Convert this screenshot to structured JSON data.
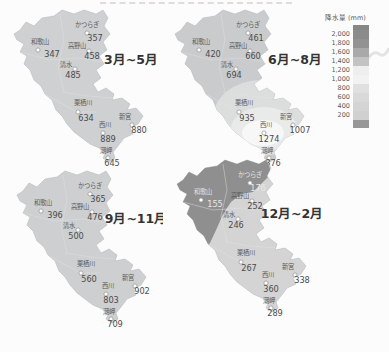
{
  "page": {
    "background": "#fcfcfc"
  },
  "legend": {
    "title": "降水量 (mm)",
    "ticks": [
      "2,000",
      "1,800",
      "1,600",
      "1,400",
      "1,200",
      "1,000",
      "800",
      "600",
      "400",
      "200"
    ],
    "band_colors": [
      "#878787",
      "#8b8b8b",
      "#929292",
      "#a9a9a9",
      "#c3c3c3",
      "#eeeeee",
      "#f2f2f2",
      "#e0e0e0",
      "#d9d9d9",
      "#d4d4d4",
      "#d0d0d0",
      "#979797"
    ]
  },
  "stations": [
    {
      "key": "katsuragi",
      "name": "かつらぎ",
      "nx": 87,
      "ny": 27,
      "dx": 87,
      "dy": 33,
      "vx": 95,
      "vy": 41
    },
    {
      "key": "wakayama",
      "name": "和歌山",
      "nx": 40,
      "ny": 44,
      "dx": 38,
      "dy": 50,
      "vx": 52,
      "vy": 57
    },
    {
      "key": "koyasan",
      "name": "高野山",
      "nx": 77,
      "ny": 48,
      "dx": 89,
      "dy": 51,
      "vx": 92,
      "vy": 59
    },
    {
      "key": "shimizu",
      "name": "清水",
      "nx": 66,
      "ny": 67,
      "dx": 75,
      "dy": 69,
      "vx": 73,
      "vy": 78
    },
    {
      "key": "kurisugawa",
      "name": "栗栖川",
      "nx": 83,
      "ny": 105,
      "dx": 78,
      "dy": 112,
      "vx": 86,
      "vy": 121
    },
    {
      "key": "nishikawa",
      "name": "西川",
      "nx": 105,
      "ny": 127,
      "dx": 103,
      "dy": 133,
      "vx": 108,
      "vy": 142
    },
    {
      "key": "shingu",
      "name": "新宮",
      "nx": 125,
      "ny": 119,
      "dx": 132,
      "dy": 125,
      "vx": 139,
      "vy": 133
    },
    {
      "key": "shionomisaki",
      "name": "潮岬",
      "nx": 106,
      "ny": 153,
      "dx": 108,
      "dy": 158,
      "vx": 112,
      "vy": 166
    }
  ],
  "maps": [
    {
      "id": "spring",
      "title": "3月~5月",
      "title_x": 131,
      "title_y": 64,
      "base_color": "#ced0d1",
      "overlays": [],
      "light_labels": [],
      "values": {
        "katsuragi": "357",
        "wakayama": "347",
        "koyasan": "458",
        "shimizu": "485",
        "kurisugawa": "634",
        "nishikawa": "889",
        "shingu": "880",
        "shionomisaki": "645"
      }
    },
    {
      "id": "summer",
      "title": "6月~8月",
      "title_x": 134,
      "title_y": 64,
      "base_color": "#c9cbcc",
      "light_labels": [],
      "overlays": [
        {
          "type": "ellipse",
          "cx": 100,
          "cy": 118,
          "rx": 48,
          "ry": 38,
          "fill": "#dcdddd"
        },
        {
          "type": "ellipse",
          "cx": 103,
          "cy": 129,
          "rx": 33,
          "ry": 22,
          "fill": "#e9eaea"
        },
        {
          "type": "ellipse",
          "cx": 102,
          "cy": 133,
          "rx": 21,
          "ry": 13,
          "fill": "#f7f7f7"
        }
      ],
      "values": {
        "katsuragi": "461",
        "wakayama": "420",
        "koyasan": "660",
        "shimizu": "694",
        "kurisugawa": "935",
        "nishikawa": "1274",
        "shingu": "1007",
        "shionomisaki": "876"
      }
    },
    {
      "id": "autumn",
      "title": "9月~11月",
      "title_x": 133,
      "title_y": 62,
      "base_color": "#cdcfd0",
      "overlays": [],
      "light_labels": [],
      "values": {
        "katsuragi": "365",
        "wakayama": "396",
        "koyasan": "476",
        "shimizu": "500",
        "kurisugawa": "560",
        "nishikawa": "803",
        "shingu": "902",
        "shionomisaki": "709"
      }
    },
    {
      "id": "winter",
      "title": "12月~2月",
      "title_x": 129,
      "title_y": 68,
      "base_color": "#d4d4d4",
      "overlays": [
        {
          "type": "polygon",
          "points": "8,20 60,10 105,10 108,24 98,34 90,42 78,44 68,52 60,64 54,78 47,93 38,103 28,107 18,97 10,78 6,48",
          "fill": "#8f8f8f"
        }
      ],
      "light_labels": [
        "katsuragi",
        "wakayama"
      ],
      "values": {
        "katsuragi": "176",
        "wakayama": "155",
        "koyasan": "252",
        "shimizu": "246",
        "kurisugawa": "267",
        "nishikawa": "360",
        "shingu": "338",
        "shionomisaki": "289"
      }
    }
  ],
  "chart_data": {
    "type": "heatmap",
    "legend_scale_mm": [
      200,
      400,
      600,
      800,
      1000,
      1200,
      1400,
      1600,
      1800,
      2000
    ],
    "seasons": [
      "3月~5月",
      "6月~8月",
      "9月~11月",
      "12月~2月"
    ],
    "stations": [
      "かつらぎ",
      "和歌山",
      "高野山",
      "清水",
      "栗栖川",
      "西川",
      "新宮",
      "潮岬"
    ],
    "series": [
      {
        "name": "3月~5月",
        "values": [
          357,
          347,
          458,
          485,
          634,
          889,
          880,
          645
        ]
      },
      {
        "name": "6月~8月",
        "values": [
          461,
          420,
          660,
          694,
          935,
          1274,
          1007,
          876
        ]
      },
      {
        "name": "9月~11月",
        "values": [
          365,
          396,
          476,
          500,
          560,
          803,
          902,
          709
        ]
      },
      {
        "name": "12月~2月",
        "values": [
          176,
          155,
          252,
          246,
          267,
          360,
          338,
          289
        ]
      }
    ]
  }
}
